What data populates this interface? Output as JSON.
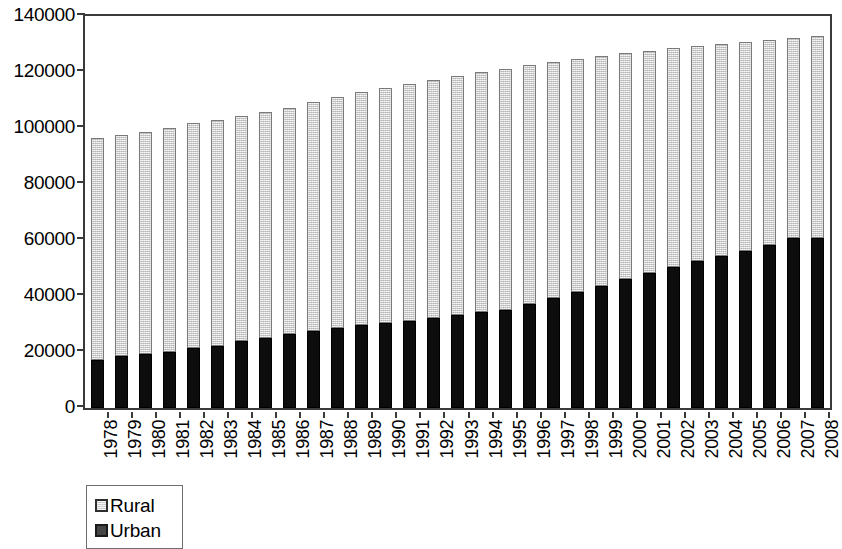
{
  "chart_data": {
    "type": "bar",
    "stacked": true,
    "title": "",
    "subtitle": "",
    "xlabel": "",
    "ylabel": "",
    "ylim": [
      0,
      140000
    ],
    "ytick_values": [
      0,
      20000,
      40000,
      60000,
      80000,
      100000,
      120000,
      140000
    ],
    "ytick_labels": [
      "0",
      "20000",
      "40000",
      "60000",
      "80000",
      "100000",
      "120000",
      "140000"
    ],
    "grid": false,
    "legend_position": "below-left",
    "categories": [
      "1978",
      "1979",
      "1980",
      "1981",
      "1982",
      "1983",
      "1984",
      "1985",
      "1986",
      "1987",
      "1988",
      "1989",
      "1990",
      "1991",
      "1992",
      "1993",
      "1994",
      "1995",
      "1996",
      "1997",
      "1998",
      "1999",
      "2000",
      "2001",
      "2002",
      "2003",
      "2004",
      "2005",
      "2006",
      "2007",
      "2008"
    ],
    "series": [
      {
        "name": "Urban",
        "color": "#0d0d0d",
        "values": [
          17245,
          18495,
          19140,
          20171,
          21480,
          22274,
          24017,
          25094,
          26366,
          27674,
          28661,
          29540,
          30195,
          31203,
          32175,
          33173,
          34169,
          35174,
          37304,
          39449,
          41608,
          43748,
          45906,
          48064,
          50212,
          52376,
          54283,
          56212,
          58288,
          60633,
          60667
        ]
      },
      {
        "name": "Rural",
        "color": "#d9d9d9",
        "values": [
          79014,
          79047,
          79565,
          79901,
          80174,
          80734,
          80340,
          80757,
          80763,
          81626,
          82365,
          83164,
          84138,
          84620,
          84996,
          85344,
          85681,
          85947,
          85085,
          84177,
          83153,
          82038,
          80837,
          79563,
          78241,
          76851,
          75705,
          74544,
          73160,
          71496,
          72135
        ]
      }
    ],
    "totals": [
      96259,
      97542,
      98705,
      100072,
      101654,
      103008,
      104357,
      105851,
      107507,
      109300,
      111026,
      112704,
      114333,
      115823,
      117171,
      118517,
      119850,
      121121,
      122389,
      123626,
      124761,
      125786,
      126743,
      127627,
      128453,
      129227,
      129988,
      130756,
      131448,
      132129,
      132802
    ],
    "legend": [
      {
        "label": "Rural",
        "marker": "light-square"
      },
      {
        "label": "Urban",
        "marker": "dark-square"
      }
    ]
  }
}
